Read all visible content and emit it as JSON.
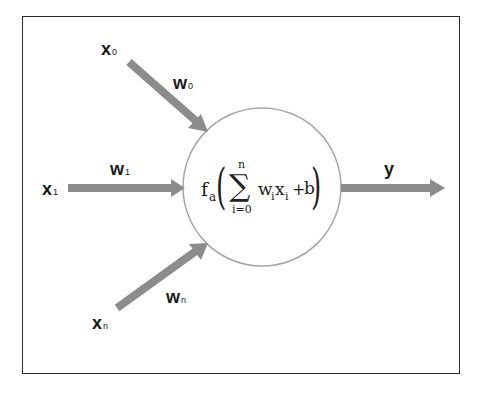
{
  "diagram": {
    "colors": {
      "arrow": "#8c8c8c",
      "circle_stroke": "#a6a6a6",
      "frame": "#2a2a2a",
      "text": "#1a1a1a"
    },
    "inputs": [
      {
        "label": "x",
        "sub": "0",
        "weight_label": "w",
        "weight_sub": "0"
      },
      {
        "label": "x",
        "sub": "1",
        "weight_label": "w",
        "weight_sub": "1"
      },
      {
        "label": "x",
        "sub": "n",
        "weight_label": "w",
        "weight_sub": "n"
      }
    ],
    "neuron": {
      "function": "f",
      "function_sub": "a",
      "sum_upper": "n",
      "sum_symbol": "∑",
      "sum_lower": "i=0",
      "term_w": "w",
      "term_w_sub": "i",
      "term_x": "x",
      "term_x_sub": "i",
      "plus": "+",
      "bias": "b",
      "open_paren": "(",
      "close_paren": ")"
    },
    "output": {
      "label": "y"
    }
  }
}
